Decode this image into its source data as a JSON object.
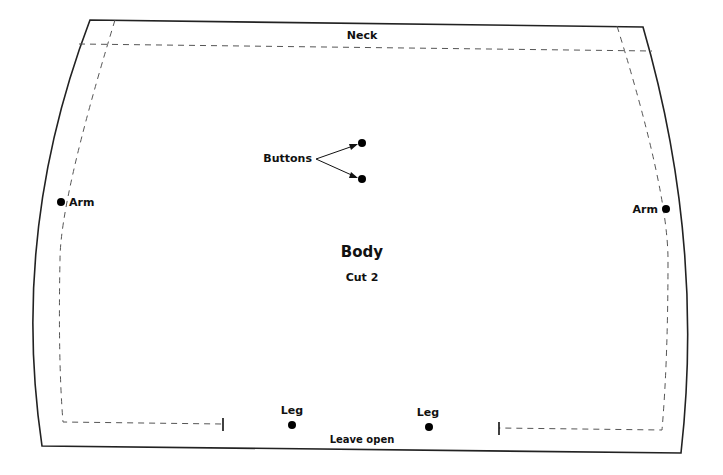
{
  "pattern": {
    "title": "Body",
    "subtitle": "Cut 2",
    "labels": {
      "neck": "Neck",
      "buttons": "Buttons",
      "arm_left": "Arm",
      "arm_right": "Arm",
      "leg_left": "Leg",
      "leg_right": "Leg",
      "leave_open": "Leave open"
    },
    "colors": {
      "outline": "#222222",
      "seam": "#555555",
      "marker": "#000000",
      "background": "#ffffff"
    }
  }
}
